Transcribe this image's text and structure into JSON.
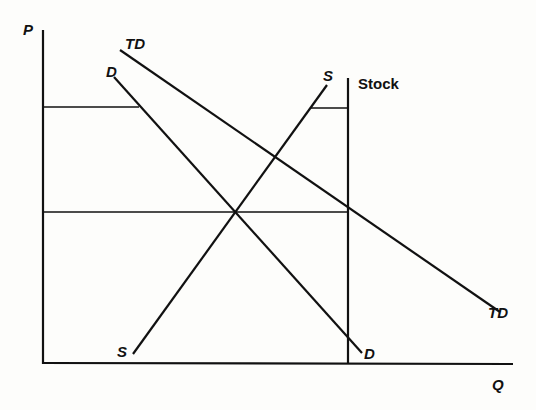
{
  "diagram": {
    "type": "supply-demand-stock",
    "axes": {
      "y_label": "P",
      "x_label": "Q"
    },
    "curves": {
      "total_demand": {
        "label_top": "TD",
        "label_bottom": "TD"
      },
      "demand": {
        "label_top": "D",
        "label_bottom": "D"
      },
      "supply": {
        "label_top": "S",
        "label_bottom": "S"
      },
      "stock": {
        "label": "Stock"
      }
    },
    "price_levels": {
      "upper": "upper price line",
      "lower": "equilibrium price line"
    },
    "colors": {
      "ink": "#111111",
      "paper": "#fdfdfb"
    }
  }
}
